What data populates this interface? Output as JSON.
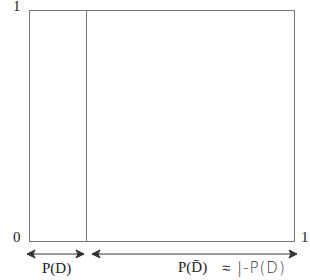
{
  "diagram": {
    "axis_labels": {
      "y_top": "1",
      "origin": "0",
      "x_right": "1"
    },
    "segments": [
      {
        "label": "P(D)",
        "from": 0,
        "to": 0.215
      },
      {
        "label": "P(D̄)",
        "from": 0.215,
        "to": 1
      }
    ],
    "annotation": "≈ |-P(D)"
  }
}
